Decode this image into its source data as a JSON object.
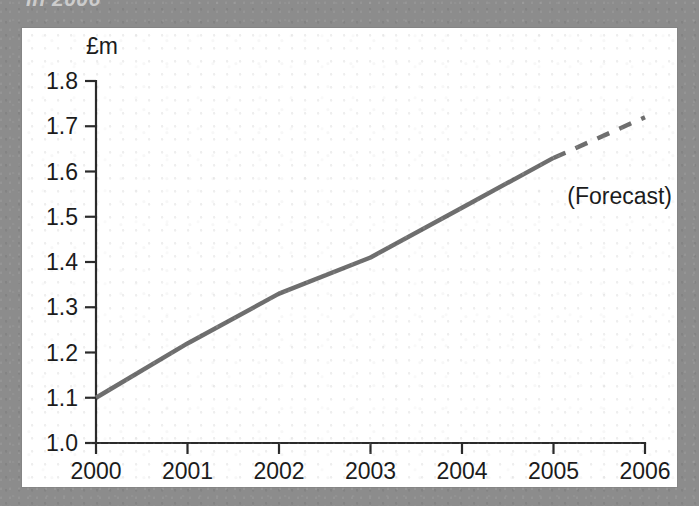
{
  "figure": {
    "clipped_caption": "in 2006",
    "frame_color": "#8c8c8c",
    "panel_color": "#ffffff"
  },
  "chart_data": {
    "type": "line",
    "title": "",
    "xlabel": "",
    "ylabel": "£m",
    "unit_label": "£m",
    "x": [
      2000,
      2001,
      2002,
      2003,
      2004,
      2005,
      2006
    ],
    "xtick_labels": [
      "2000",
      "2001",
      "2002",
      "2003",
      "2004",
      "2005",
      "2006"
    ],
    "ytick_labels": [
      "1.0",
      "1.1",
      "1.2",
      "1.3",
      "1.4",
      "1.5",
      "1.6",
      "1.7",
      "1.8"
    ],
    "ytick_values": [
      1.0,
      1.1,
      1.2,
      1.3,
      1.4,
      1.5,
      1.6,
      1.7,
      1.8
    ],
    "xlim": [
      2000,
      2006
    ],
    "ylim": [
      1.0,
      1.8
    ],
    "grid": false,
    "legend": "none",
    "line_color": "#6e6e6e",
    "series": [
      {
        "name": "Actual",
        "style": "solid",
        "x": [
          2000,
          2001,
          2002,
          2003,
          2004,
          2005
        ],
        "values": [
          1.1,
          1.22,
          1.33,
          1.41,
          1.52,
          1.63
        ]
      },
      {
        "name": "Forecast",
        "style": "dashed",
        "x": [
          2005,
          2006
        ],
        "values": [
          1.63,
          1.72
        ]
      }
    ],
    "annotations": [
      {
        "text": "(Forecast)",
        "x": 2005.15,
        "y": 1.545
      }
    ]
  }
}
